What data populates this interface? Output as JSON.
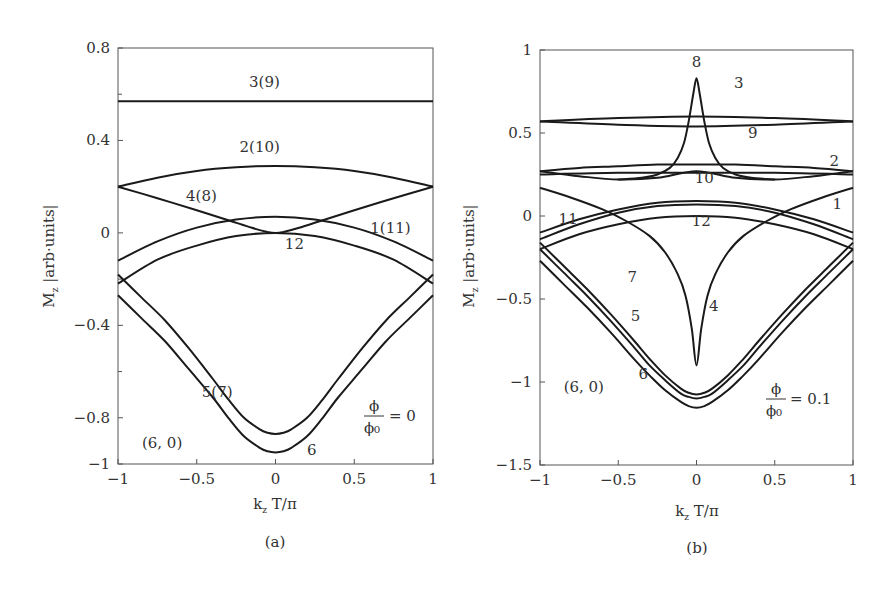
{
  "chart_data": [
    {
      "panel": "a",
      "type": "line",
      "panel_label": "(a)",
      "xlabel": "k_z T/π",
      "ylabel": "M_z |arb·units|",
      "xlim": [
        -1,
        1
      ],
      "ylim": [
        -1,
        0.8
      ],
      "xticks": [
        -1,
        -0.5,
        0,
        0.5,
        1
      ],
      "xtick_labels": [
        "−1",
        "−0.5",
        "0",
        "0.5",
        "1"
      ],
      "yticks": [
        0.8,
        0.4,
        0,
        -0.4,
        -0.8,
        -1
      ],
      "ytick_labels": [
        "0.8",
        "0.4",
        "0",
        "−0.4",
        "−0.8",
        "−1"
      ],
      "minor_yticks": [
        0.6,
        0.2,
        -0.2,
        -0.6
      ],
      "grid": false,
      "annotations": [
        {
          "text": "3(9)",
          "x": -0.07,
          "y": 0.63
        },
        {
          "text": "2(10)",
          "x": -0.1,
          "y": 0.35
        },
        {
          "text": "4(8)",
          "x": -0.47,
          "y": 0.14
        },
        {
          "text": "1(11)",
          "x": 0.73,
          "y": 0.0
        },
        {
          "text": "12",
          "x": 0.12,
          "y": -0.07
        },
        {
          "text": "5(7)",
          "x": -0.37,
          "y": -0.71
        },
        {
          "text": "6",
          "x": 0.23,
          "y": -0.96
        },
        {
          "text": "(6, 0)",
          "x": -0.72,
          "y": -0.93
        }
      ],
      "flux_label": {
        "numerator": "ϕ",
        "denominator": "ϕ₀",
        "value": "= 0"
      },
      "series": [
        {
          "name": "3(9)",
          "x": [
            -1,
            1
          ],
          "y": [
            0.57,
            0.57
          ]
        },
        {
          "name": "2(10)",
          "x": [
            -1,
            -0.75,
            -0.5,
            -0.25,
            0,
            0.25,
            0.5,
            0.75,
            1
          ],
          "y": [
            0.2,
            0.239,
            0.268,
            0.284,
            0.29,
            0.284,
            0.268,
            0.239,
            0.2
          ]
        },
        {
          "name": "4(8)",
          "x": [
            -1,
            -0.75,
            -0.5,
            -0.3,
            -0.15,
            -0.05,
            0,
            0.05,
            0.15,
            0.3,
            0.5,
            0.75,
            1
          ],
          "y": [
            0.2,
            0.15,
            0.098,
            0.055,
            0.022,
            0.004,
            0.0,
            0.004,
            0.022,
            0.055,
            0.098,
            0.15,
            0.2
          ]
        },
        {
          "name": "1(11)",
          "x": [
            -1,
            -0.75,
            -0.5,
            -0.25,
            0,
            0.25,
            0.5,
            0.75,
            1
          ],
          "y": [
            -0.12,
            -0.037,
            0.023,
            0.058,
            0.07,
            0.058,
            0.023,
            -0.037,
            -0.12
          ]
        },
        {
          "name": "12",
          "x": [
            -1,
            -0.75,
            -0.5,
            -0.25,
            0,
            0.25,
            0.5,
            0.75,
            1
          ],
          "y": [
            -0.22,
            -0.116,
            -0.055,
            -0.014,
            0.0,
            -0.014,
            -0.055,
            -0.116,
            -0.22
          ]
        },
        {
          "name": "5(7)",
          "x": [
            -1,
            -0.85,
            -0.7,
            -0.55,
            -0.4,
            -0.3,
            -0.2,
            -0.1,
            -0.05,
            0,
            0.05,
            0.1,
            0.2,
            0.3,
            0.4,
            0.55,
            0.7,
            0.85,
            1
          ],
          "y": [
            -0.18,
            -0.28,
            -0.38,
            -0.5,
            -0.63,
            -0.72,
            -0.8,
            -0.85,
            -0.865,
            -0.87,
            -0.865,
            -0.85,
            -0.8,
            -0.72,
            -0.63,
            -0.5,
            -0.38,
            -0.28,
            -0.18
          ]
        },
        {
          "name": "6",
          "x": [
            -1,
            -0.85,
            -0.7,
            -0.55,
            -0.4,
            -0.3,
            -0.2,
            -0.1,
            -0.05,
            0,
            0.05,
            0.1,
            0.2,
            0.3,
            0.4,
            0.55,
            0.7,
            0.85,
            1
          ],
          "y": [
            -0.27,
            -0.37,
            -0.47,
            -0.59,
            -0.71,
            -0.8,
            -0.88,
            -0.93,
            -0.945,
            -0.95,
            -0.945,
            -0.93,
            -0.88,
            -0.8,
            -0.71,
            -0.59,
            -0.47,
            -0.37,
            -0.27
          ]
        }
      ]
    },
    {
      "panel": "b",
      "type": "line",
      "panel_label": "(b)",
      "xlabel": "k_z T/π",
      "ylabel": "M_z |arb·units|",
      "xlim": [
        -1,
        1
      ],
      "ylim": [
        -1.5,
        1
      ],
      "xticks": [
        -1,
        -0.5,
        0,
        0.5,
        1
      ],
      "xtick_labels": [
        "−1",
        "−0.5",
        "0",
        "0.5",
        "1"
      ],
      "yticks": [
        1,
        0.5,
        0,
        -0.5,
        -1,
        -1.5
      ],
      "ytick_labels": [
        "1",
        "0.5",
        "0",
        "−0.5",
        "−1",
        "−1.5"
      ],
      "grid": false,
      "annotations": [
        {
          "text": "8",
          "x": 0.0,
          "y": 0.9
        },
        {
          "text": "3",
          "x": 0.27,
          "y": 0.77
        },
        {
          "text": "9",
          "x": 0.36,
          "y": 0.47
        },
        {
          "text": "2",
          "x": 0.88,
          "y": 0.3
        },
        {
          "text": "10",
          "x": 0.05,
          "y": 0.2
        },
        {
          "text": "1",
          "x": 0.9,
          "y": 0.04
        },
        {
          "text": "11",
          "x": -0.82,
          "y": -0.05
        },
        {
          "text": "12",
          "x": 0.03,
          "y": -0.06
        },
        {
          "text": "7",
          "x": -0.41,
          "y": -0.4
        },
        {
          "text": "4",
          "x": 0.11,
          "y": -0.57
        },
        {
          "text": "5",
          "x": -0.39,
          "y": -0.63
        },
        {
          "text": "6",
          "x": -0.34,
          "y": -0.98
        },
        {
          "text": "(6, 0)",
          "x": -0.72,
          "y": -1.06
        }
      ],
      "flux_label": {
        "numerator": "ϕ",
        "denominator": "ϕ₀",
        "value": "= 0.1"
      },
      "series": [
        {
          "name": "3",
          "x": [
            -1,
            -0.5,
            0,
            0.5,
            1
          ],
          "y": [
            0.57,
            0.59,
            0.6,
            0.59,
            0.57
          ]
        },
        {
          "name": "9",
          "x": [
            -1,
            -0.5,
            0,
            0.5,
            1
          ],
          "y": [
            0.57,
            0.55,
            0.54,
            0.55,
            0.57
          ]
        },
        {
          "name": "8",
          "x": [
            -0.5,
            -0.35,
            -0.25,
            -0.17,
            -0.12,
            -0.08,
            -0.05,
            -0.02,
            0,
            0.02,
            0.05,
            0.08,
            0.12,
            0.17,
            0.25,
            0.35,
            0.5
          ],
          "y": [
            0.22,
            0.23,
            0.25,
            0.29,
            0.35,
            0.44,
            0.57,
            0.74,
            0.83,
            0.74,
            0.57,
            0.44,
            0.35,
            0.29,
            0.25,
            0.23,
            0.22
          ]
        },
        {
          "name": "2",
          "x": [
            -1,
            -0.75,
            -0.5,
            -0.25,
            0,
            0.25,
            0.5,
            0.75,
            1
          ],
          "y": [
            0.27,
            0.29,
            0.3,
            0.31,
            0.31,
            0.31,
            0.3,
            0.29,
            0.27
          ]
        },
        {
          "name": "10",
          "x": [
            -1,
            -0.5,
            0,
            0.5,
            1
          ],
          "y": [
            0.25,
            0.26,
            0.26,
            0.26,
            0.25
          ]
        },
        {
          "name": "2b",
          "x": [
            -1,
            -0.75,
            -0.5,
            -0.25,
            0,
            0.25,
            0.5,
            0.75,
            1
          ],
          "y": [
            0.27,
            0.24,
            0.22,
            0.23,
            0.27,
            0.23,
            0.22,
            0.24,
            0.27
          ]
        },
        {
          "name": "4",
          "x": [
            -1,
            -0.8,
            -0.6,
            -0.45,
            -0.3,
            -0.2,
            -0.12,
            -0.07,
            -0.03,
            0,
            0.03,
            0.07,
            0.12,
            0.2,
            0.3,
            0.45,
            0.6,
            0.8,
            1
          ],
          "y": [
            0.17,
            0.11,
            0.04,
            -0.03,
            -0.12,
            -0.22,
            -0.35,
            -0.48,
            -0.68,
            -0.9,
            -0.68,
            -0.48,
            -0.35,
            -0.22,
            -0.12,
            -0.03,
            0.04,
            0.11,
            0.17
          ]
        },
        {
          "name": "1",
          "x": [
            -1,
            -0.75,
            -0.5,
            -0.25,
            0,
            0.25,
            0.5,
            0.75,
            1
          ],
          "y": [
            -0.1,
            -0.02,
            0.04,
            0.08,
            0.09,
            0.08,
            0.04,
            -0.02,
            -0.1
          ]
        },
        {
          "name": "11",
          "x": [
            -1,
            -0.75,
            -0.5,
            -0.25,
            0,
            0.25,
            0.5,
            0.75,
            1
          ],
          "y": [
            -0.14,
            -0.05,
            0.02,
            0.06,
            0.07,
            0.06,
            0.02,
            -0.05,
            -0.14
          ]
        },
        {
          "name": "12",
          "x": [
            -1,
            -0.75,
            -0.5,
            -0.25,
            0,
            0.25,
            0.5,
            0.75,
            1
          ],
          "y": [
            -0.2,
            -0.11,
            -0.05,
            -0.01,
            0.0,
            -0.01,
            -0.05,
            -0.11,
            -0.2
          ]
        },
        {
          "name": "7",
          "x": [
            -1,
            -0.85,
            -0.7,
            -0.55,
            -0.4,
            -0.3,
            -0.2,
            -0.1,
            -0.05,
            0,
            0.05,
            0.1,
            0.2,
            0.3,
            0.4,
            0.55,
            0.7,
            0.85,
            1
          ],
          "y": [
            -0.16,
            -0.3,
            -0.44,
            -0.59,
            -0.75,
            -0.86,
            -0.96,
            -1.04,
            -1.065,
            -1.075,
            -1.065,
            -1.04,
            -0.96,
            -0.86,
            -0.75,
            -0.59,
            -0.44,
            -0.3,
            -0.16
          ]
        },
        {
          "name": "5",
          "x": [
            -1,
            -0.85,
            -0.7,
            -0.55,
            -0.4,
            -0.3,
            -0.2,
            -0.1,
            -0.05,
            0,
            0.05,
            0.1,
            0.2,
            0.3,
            0.4,
            0.55,
            0.7,
            0.85,
            1
          ],
          "y": [
            -0.2,
            -0.34,
            -0.48,
            -0.63,
            -0.79,
            -0.9,
            -0.99,
            -1.07,
            -1.09,
            -1.1,
            -1.09,
            -1.07,
            -0.99,
            -0.9,
            -0.79,
            -0.63,
            -0.48,
            -0.34,
            -0.2
          ]
        },
        {
          "name": "6",
          "x": [
            -1,
            -0.85,
            -0.7,
            -0.55,
            -0.4,
            -0.3,
            -0.2,
            -0.1,
            -0.05,
            0,
            0.05,
            0.1,
            0.2,
            0.3,
            0.4,
            0.55,
            0.7,
            0.85,
            1
          ],
          "y": [
            -0.27,
            -0.41,
            -0.55,
            -0.7,
            -0.86,
            -0.96,
            -1.05,
            -1.12,
            -1.145,
            -1.155,
            -1.145,
            -1.12,
            -1.05,
            -0.96,
            -0.86,
            -0.7,
            -0.55,
            -0.41,
            -0.27
          ]
        }
      ]
    }
  ]
}
